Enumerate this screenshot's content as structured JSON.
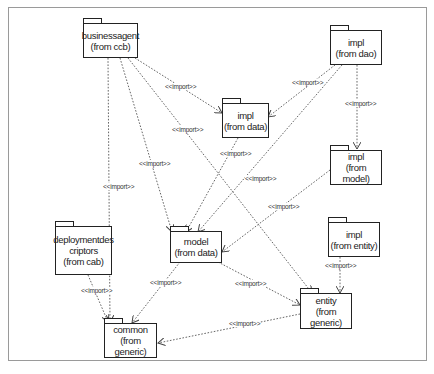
{
  "diagram": {
    "type": "UML package dependency diagram",
    "stereotype_label": "<<import>>",
    "packages": [
      {
        "id": "businessagent",
        "name": "businessagent",
        "from": "(from ccb)"
      },
      {
        "id": "impl_dao",
        "name": "impl",
        "from": "(from dao)"
      },
      {
        "id": "impl_data",
        "name": "impl",
        "from": "(from data)"
      },
      {
        "id": "impl_model",
        "name": "impl",
        "from": "(from model)"
      },
      {
        "id": "deploymentdescriptors",
        "name": "deploymentdes",
        "name2": "criptors",
        "from": "(from cab)"
      },
      {
        "id": "model",
        "name": "model",
        "from": "(from data)"
      },
      {
        "id": "impl_entity",
        "name": "impl",
        "from": "(from entity)"
      },
      {
        "id": "entity",
        "name": "entity",
        "from": "(from generic)"
      },
      {
        "id": "common",
        "name": "common",
        "from": "(from generic)"
      }
    ],
    "dependencies": [
      {
        "from": "businessagent",
        "to": "impl_data",
        "label": "<<import>>"
      },
      {
        "from": "businessagent",
        "to": "model",
        "label": "<<import>>"
      },
      {
        "from": "businessagent",
        "to": "entity",
        "label": "<<import>>"
      },
      {
        "from": "businessagent",
        "to": "common",
        "label": "<<import>>"
      },
      {
        "from": "impl_dao",
        "to": "impl_data",
        "label": "<<import>>"
      },
      {
        "from": "impl_dao",
        "to": "model",
        "label": "<<import>>"
      },
      {
        "from": "impl_dao",
        "to": "impl_model",
        "label": "<<import>>"
      },
      {
        "from": "impl_data",
        "to": "model",
        "label": "<<import>>"
      },
      {
        "from": "impl_model",
        "to": "model",
        "label": "<<import>>"
      },
      {
        "from": "deploymentdescriptors",
        "to": "common",
        "label": "<<import>>"
      },
      {
        "from": "model",
        "to": "common",
        "label": "<<import>>"
      },
      {
        "from": "model",
        "to": "entity",
        "label": "<<import>>"
      },
      {
        "from": "impl_entity",
        "to": "entity",
        "label": "<<import>>"
      },
      {
        "from": "entity",
        "to": "common",
        "label": "<<import>>"
      }
    ]
  }
}
